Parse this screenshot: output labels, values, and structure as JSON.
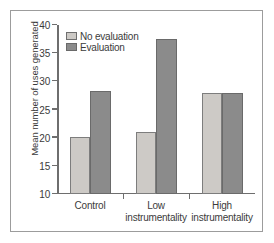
{
  "chart_data": {
    "type": "bar",
    "title": "",
    "xlabel": "",
    "ylabel": "Mean number of uses generated",
    "categories": [
      "Control",
      "Low instrumentality",
      "High instrumentality"
    ],
    "category_lines": [
      [
        "Control",
        ""
      ],
      [
        "Low",
        "instrumentality"
      ],
      [
        "High",
        "instrumentality"
      ]
    ],
    "series": [
      {
        "name": "No evaluation",
        "values": [
          20.2,
          21.0,
          28.0
        ],
        "color": "#cdcac6"
      },
      {
        "name": "Evaluation",
        "values": [
          28.2,
          37.5,
          28.0
        ],
        "color": "#8b8b8b"
      }
    ],
    "ylim": [
      10,
      40
    ],
    "yticks": [
      10,
      15,
      20,
      25,
      30,
      35,
      40
    ],
    "ytick_labels": [
      "10",
      "15",
      "20",
      "25",
      "30",
      "35",
      "40"
    ],
    "grid": false,
    "legend_position": "top-left"
  },
  "legend": {
    "items": [
      {
        "label": "No evaluation",
        "swatch": "light-gray-swatch"
      },
      {
        "label": "Evaluation",
        "swatch": "dark-gray-swatch"
      }
    ]
  }
}
